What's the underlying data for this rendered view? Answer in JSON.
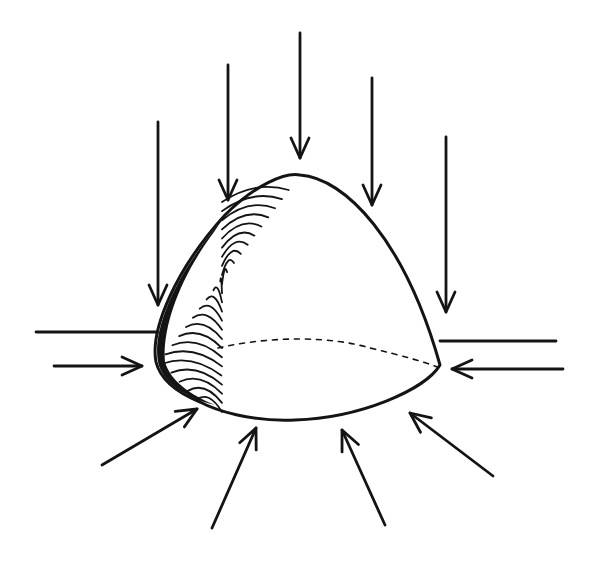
{
  "diagram": {
    "colors": {
      "ink": "#141414",
      "background": "#ffffff"
    },
    "shape": {
      "outline": "M156,362 C150,330 175,270 225,215 C255,185 285,172 300,175 C345,178 405,240 440,365 C425,390 360,418 295,420 C250,422 215,410 200,402 C175,392 160,378 156,362 Z",
      "hidden_equator": "M218,348 C270,336 330,336 370,348 C400,355 425,362 440,368"
    },
    "arrows": {
      "vertical_top": [
        {
          "x1": 158,
          "y1": 122,
          "x2": 158,
          "y2": 305
        },
        {
          "x1": 228,
          "y1": 65,
          "x2": 228,
          "y2": 200
        },
        {
          "x1": 300,
          "y1": 33,
          "x2": 300,
          "y2": 158
        },
        {
          "x1": 372,
          "y1": 78,
          "x2": 372,
          "y2": 205
        },
        {
          "x1": 446,
          "y1": 137,
          "x2": 446,
          "y2": 312
        }
      ],
      "horizontal": [
        {
          "x1": 54,
          "y1": 366,
          "x2": 142,
          "y2": 366
        },
        {
          "x1": 563,
          "y1": 369,
          "x2": 452,
          "y2": 369
        }
      ],
      "diagonal_bottom": [
        {
          "x1": 102,
          "y1": 465,
          "x2": 197,
          "y2": 409
        },
        {
          "x1": 212,
          "y1": 528,
          "x2": 256,
          "y2": 428
        },
        {
          "x1": 385,
          "y1": 525,
          "x2": 342,
          "y2": 430
        },
        {
          "x1": 493,
          "y1": 476,
          "x2": 410,
          "y2": 413
        }
      ]
    },
    "plain_lines": [
      {
        "x1": 36,
        "y1": 332,
        "x2": 158,
        "y2": 332
      },
      {
        "x1": 440,
        "y1": 341,
        "x2": 556,
        "y2": 341
      }
    ]
  }
}
